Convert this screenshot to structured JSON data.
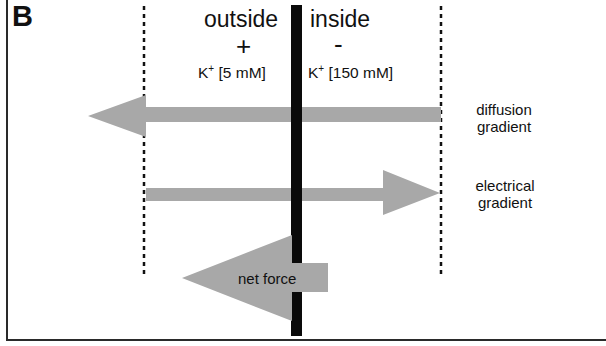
{
  "figure": {
    "panel_label": "B",
    "outside": {
      "title": "outside",
      "charge_sign": "+",
      "ion": "K",
      "ion_charge": "+",
      "concentration": "[5 mM]"
    },
    "inside": {
      "title": "inside",
      "charge_sign": "-",
      "ion": "K",
      "ion_charge": "+",
      "concentration": "[150 mM]"
    },
    "arrows": {
      "diffusion": {
        "label_line1": "diffusion",
        "label_line2": "gradient",
        "direction": "left"
      },
      "electrical": {
        "label_line1": "electrical",
        "label_line2": "gradient",
        "direction": "right"
      },
      "net": {
        "label": "net force",
        "direction": "left"
      }
    },
    "colors": {
      "arrow_fill": "#a8a8a8",
      "membrane": "#0a0a0a",
      "dotted_lines": "#111111",
      "background": "#ffffff"
    }
  }
}
